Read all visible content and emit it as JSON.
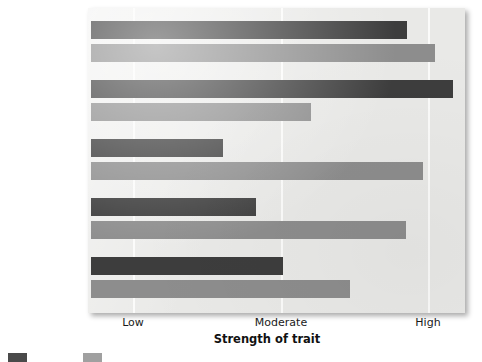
{
  "chart_data": {
    "type": "bar",
    "orientation": "horizontal",
    "title": "",
    "xlabel": "Strength of trait",
    "ylabel": "",
    "categories": [
      "Industry",
      "Generosity",
      "Nervousness",
      "Extraversion",
      "Aggression"
    ],
    "x_tick_labels": [
      "Low",
      "Moderate",
      "High"
    ],
    "x_tick_values": [
      1,
      2,
      3
    ],
    "xlim": [
      0.715,
      3.25
    ],
    "grid": true,
    "grid_axis": "x",
    "legend_position": "bottom-left",
    "series": [
      {
        "name": "",
        "color": "#3d3d3d",
        "values": [
          2.86,
          3.17,
          1.61,
          1.83,
          2.02
        ]
      },
      {
        "name": "",
        "color": "#8d8d8d",
        "values": [
          3.05,
          2.2,
          2.97,
          2.85,
          2.47
        ]
      }
    ]
  },
  "axis": {
    "title": "Strength of trait",
    "ticks": [
      {
        "label": "Low",
        "x": 133
      },
      {
        "label": "Moderate",
        "x": 281
      },
      {
        "label": "High",
        "x": 428
      }
    ]
  },
  "categories": [
    {
      "label": "Industry",
      "dark_end": 407,
      "light_end": 435,
      "dark_top": 21,
      "light_top": 44
    },
    {
      "label": "Generosity",
      "dark_end": 453,
      "light_end": 311,
      "dark_top": 80,
      "light_top": 103
    },
    {
      "label": "Nervousness",
      "dark_end": 223,
      "light_end": 423,
      "dark_top": 139,
      "light_top": 162
    },
    {
      "label": "Extraversion",
      "dark_end": 256,
      "light_end": 406,
      "dark_top": 198,
      "light_top": 221
    },
    {
      "label": "Aggression",
      "dark_end": 283,
      "light_end": 350,
      "dark_top": 257,
      "light_top": 280
    }
  ],
  "legend": {
    "entries": [
      {
        "label": "",
        "color": "#4a4a4a"
      },
      {
        "label": "",
        "color": "#a0a0a0"
      }
    ]
  },
  "colors": {
    "dark_series": "#3d3d3d",
    "light_series": "#8d8d8d",
    "plot_background": "#e9e9e7",
    "gridline": "#fbfbfa",
    "text": "#111111"
  }
}
